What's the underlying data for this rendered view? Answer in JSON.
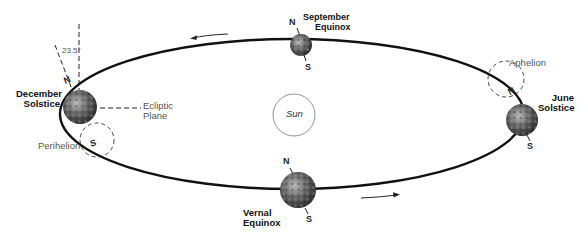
{
  "diagram": {
    "sun_label": "Sun",
    "tilt_angle": "23.5°",
    "ecliptic_label_line1": "Ecliptic",
    "ecliptic_label_line2": "Plane",
    "perihelion_label": "Perihelion",
    "aphelion_label": "Aphelion",
    "positions": {
      "december": {
        "line1": "December",
        "line2": "Solstice"
      },
      "september": {
        "line1": "September",
        "line2": "Equinox"
      },
      "june": {
        "line1": "June",
        "line2": "Solstice"
      },
      "vernal": {
        "line1": "Vernal",
        "line2": "Equinox"
      }
    },
    "pole_north": "N",
    "pole_south": "S"
  }
}
